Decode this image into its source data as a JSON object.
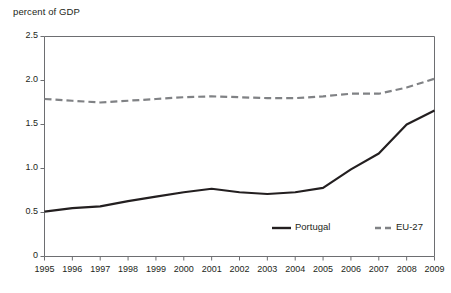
{
  "chart_data": {
    "type": "line",
    "title": "",
    "ylabel": "percent of GDP",
    "xlabel": "",
    "categories": [
      "1995",
      "1996",
      "1997",
      "1998",
      "1999",
      "2000",
      "2001",
      "2002",
      "2003",
      "2004",
      "2005",
      "2006",
      "2007",
      "2008",
      "2009"
    ],
    "yticks": [
      "0",
      "0.5",
      "1.0",
      "1.5",
      "2.0",
      "2.5"
    ],
    "ytick_values": [
      0,
      0.5,
      1.0,
      1.5,
      2.0,
      2.5
    ],
    "ylim": [
      0,
      2.5
    ],
    "grid": false,
    "legend_position": "inside-bottom-right",
    "series": [
      {
        "name": "Portugal",
        "style": "solid",
        "color": "#231f20",
        "values": [
          0.51,
          0.55,
          0.57,
          0.63,
          0.68,
          0.73,
          0.77,
          0.73,
          0.71,
          0.73,
          0.78,
          0.99,
          1.17,
          1.5,
          1.66
        ]
      },
      {
        "name": "EU-27",
        "style": "dashed",
        "color": "#808285",
        "values": [
          1.79,
          1.77,
          1.75,
          1.77,
          1.79,
          1.81,
          1.82,
          1.81,
          1.8,
          1.8,
          1.82,
          1.85,
          1.85,
          1.92,
          2.02
        ]
      }
    ]
  },
  "legend": {
    "items": [
      {
        "label": "Portugal",
        "style": "solid",
        "color": "#231f20"
      },
      {
        "label": "EU-27",
        "style": "dashed",
        "color": "#808285"
      }
    ]
  },
  "axis": {
    "y_title": "percent of GDP"
  }
}
